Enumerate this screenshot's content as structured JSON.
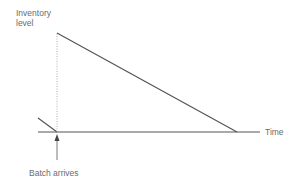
{
  "diagram": {
    "title": "",
    "y_axis_label_line1": "Inventory",
    "y_axis_label_line2": "level",
    "x_axis_label": "Time",
    "event_label": "Batch arrives",
    "colors": {
      "line": "#555555",
      "dotted": "#9a9a9a",
      "text": "#6b6b6b"
    },
    "elements": [
      {
        "type": "baseline",
        "from": [
          38,
          132
        ],
        "to": [
          260,
          132
        ]
      },
      {
        "type": "prior-depletion-segment",
        "from": [
          38,
          118
        ],
        "to": [
          57,
          132
        ]
      },
      {
        "type": "replenishment-dotted-line",
        "from": [
          57,
          132
        ],
        "to": [
          57,
          33
        ]
      },
      {
        "type": "depletion-line",
        "from": [
          57,
          33
        ],
        "to": [
          237,
          132
        ]
      },
      {
        "type": "arrow",
        "from": [
          57,
          160
        ],
        "to": [
          57,
          135
        ]
      }
    ]
  }
}
